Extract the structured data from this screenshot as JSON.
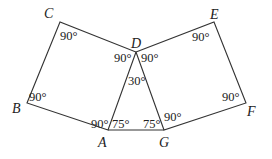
{
  "diagram": {
    "type": "geometry",
    "points": {
      "A": {
        "label": "A",
        "x": 108,
        "y": 130
      },
      "B": {
        "label": "B",
        "x": 27,
        "y": 103
      },
      "C": {
        "label": "C",
        "x": 60,
        "y": 22
      },
      "D": {
        "label": "D",
        "x": 136,
        "y": 52
      },
      "E": {
        "label": "E",
        "x": 214,
        "y": 22
      },
      "F": {
        "label": "F",
        "x": 246,
        "y": 103
      },
      "G": {
        "label": "G",
        "x": 164,
        "y": 130
      }
    },
    "labels": {
      "A": "A",
      "B": "B",
      "C": "C",
      "D": "D",
      "E": "E",
      "F": "F",
      "G": "G"
    },
    "angles": {
      "C": "90°",
      "B": "90°",
      "D_left": "90°",
      "D_right": "90°",
      "D_triangle": "30°",
      "E": "90°",
      "F": "90°",
      "A_square": "90°",
      "A_triangle": "75°",
      "G_triangle": "75°",
      "G_square": "90°"
    },
    "polygons": [
      {
        "name": "ABCD",
        "vertices": [
          "A",
          "B",
          "C",
          "D"
        ]
      },
      {
        "name": "DEFG",
        "vertices": [
          "D",
          "E",
          "F",
          "G"
        ]
      },
      {
        "name": "ADG",
        "vertices": [
          "A",
          "D",
          "G"
        ]
      }
    ]
  }
}
